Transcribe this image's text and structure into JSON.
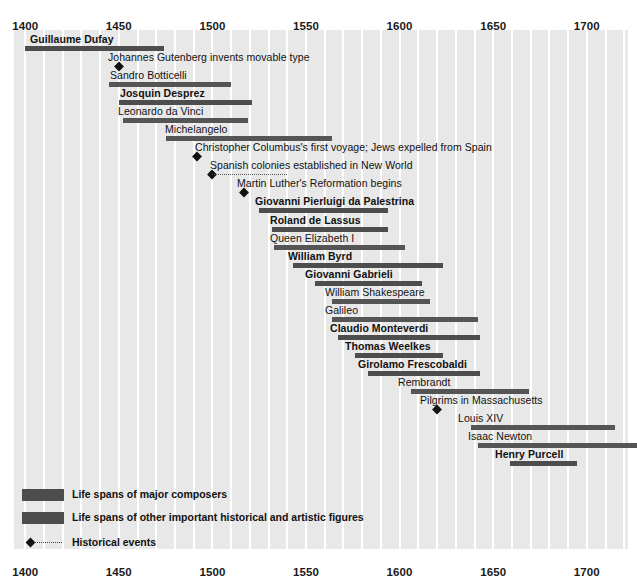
{
  "chart_data": {
    "type": "table",
    "title": "",
    "xlabel": "",
    "ylabel": "",
    "xlim": [
      1394,
      1722
    ],
    "grid": true,
    "grid_interval": 10,
    "legend_position": "bottom-left",
    "axis": {
      "ticks": [
        1400,
        1450,
        1500,
        1550,
        1600,
        1650,
        1700
      ],
      "tick_labels": [
        "1400",
        "1450",
        "1500",
        "1550",
        "1600",
        "1650",
        "1700"
      ],
      "top_axis": true,
      "bottom_axis": true
    },
    "categories": [
      "Guillaume Dufay",
      "Johannes Gutenberg invents movable type",
      "Sandro Botticelli",
      "Josquin Desprez",
      "Leonardo da Vinci",
      "Michelangelo",
      "Christopher Columbus's first voyage; Jews expelled from Spain",
      "Spanish colonies established in New World",
      "Martin Luther's Reformation begins",
      "Giovanni Pierluigi da Palestrina",
      "Roland de Lassus",
      "Queen Elizabeth I",
      "William Byrd",
      "Giovanni Gabrieli",
      "William Shakespeare",
      "Galileo",
      "Claudio Monteverdi",
      "Thomas Weelkes",
      "Girolamo Frescobaldi",
      "Rembrandt",
      "Pilgrims in Massachusetts",
      "Louis XIV",
      "Isaac Newton",
      "Henry Purcell"
    ],
    "series": [
      {
        "name": "Life spans of major composers",
        "color": "#4d4d4d",
        "spans": [
          {
            "label": "Guillaume Dufay",
            "start": 1400,
            "end": 1474
          },
          {
            "label": "Josquin Desprez",
            "start": 1450,
            "end": 1521
          },
          {
            "label": "Giovanni Pierluigi da Palestrina",
            "start": 1525,
            "end": 1594
          },
          {
            "label": "Roland de Lassus",
            "start": 1532,
            "end": 1594
          },
          {
            "label": "William Byrd",
            "start": 1543,
            "end": 1623
          },
          {
            "label": "Giovanni Gabrieli",
            "start": 1555,
            "end": 1612
          },
          {
            "label": "Claudio Monteverdi",
            "start": 1567,
            "end": 1643
          },
          {
            "label": "Thomas Weelkes",
            "start": 1576,
            "end": 1623
          },
          {
            "label": "Girolamo Frescobaldi",
            "start": 1583,
            "end": 1643
          },
          {
            "label": "Henry Purcell",
            "start": 1659,
            "end": 1695
          }
        ]
      },
      {
        "name": "Life spans of other important historical and artistic figures",
        "color": "#555555",
        "spans": [
          {
            "label": "Sandro Botticelli",
            "start": 1445,
            "end": 1510
          },
          {
            "label": "Leonardo da Vinci",
            "start": 1452,
            "end": 1519
          },
          {
            "label": "Michelangelo",
            "start": 1475,
            "end": 1564
          },
          {
            "label": "Queen Elizabeth I",
            "start": 1533,
            "end": 1603
          },
          {
            "label": "William Shakespeare",
            "start": 1564,
            "end": 1616
          },
          {
            "label": "Galileo",
            "start": 1564,
            "end": 1642
          },
          {
            "label": "Rembrandt",
            "start": 1606,
            "end": 1669
          },
          {
            "label": "Louis XIV",
            "start": 1638,
            "end": 1715
          },
          {
            "label": "Isaac Newton",
            "start": 1642,
            "end": 1727
          }
        ]
      }
    ],
    "events": [
      {
        "label": "Johannes Gutenberg invents movable type",
        "year": 1450
      },
      {
        "label": "Christopher Columbus's first voyage; Jews expelled from Spain",
        "year": 1492
      },
      {
        "label": "Spanish colonies established in New World",
        "year": 1500,
        "span_end": 1540
      },
      {
        "label": "Martin Luther's Reformation begins",
        "year": 1517
      },
      {
        "label": "Pilgrims in Massachusetts",
        "year": 1620
      }
    ]
  },
  "rows": [
    {
      "label": "Guillaume Dufay",
      "kind": "composer",
      "start": 1400,
      "end": 1474,
      "label_x": 30
    },
    {
      "label": "Johannes Gutenberg invents movable type",
      "kind": "event",
      "year": 1450,
      "label_x": 108
    },
    {
      "label": "Sandro Botticelli",
      "kind": "other",
      "start": 1445,
      "end": 1510,
      "label_x": 110
    },
    {
      "label": "Josquin Desprez",
      "kind": "composer",
      "start": 1450,
      "end": 1521,
      "label_x": 120
    },
    {
      "label": "Leonardo da Vinci",
      "kind": "other",
      "start": 1452,
      "end": 1519,
      "label_x": 118
    },
    {
      "label": "Michelangelo",
      "kind": "other",
      "start": 1475,
      "end": 1564,
      "label_x": 165
    },
    {
      "label": "Christopher Columbus's first voyage; Jews expelled from Spain",
      "kind": "event",
      "year": 1492,
      "label_x": 195
    },
    {
      "label": "Spanish colonies established in New World",
      "kind": "event",
      "year": 1500,
      "span_end": 1540,
      "label_x": 210
    },
    {
      "label": "Martin Luther's Reformation begins",
      "kind": "event",
      "year": 1517,
      "label_x": 237
    },
    {
      "label": "Giovanni Pierluigi da Palestrina",
      "kind": "composer",
      "start": 1525,
      "end": 1594,
      "label_x": 255
    },
    {
      "label": "Roland de Lassus",
      "kind": "composer",
      "start": 1532,
      "end": 1594,
      "label_x": 270
    },
    {
      "label": "Queen Elizabeth I",
      "kind": "other",
      "start": 1533,
      "end": 1603,
      "label_x": 270
    },
    {
      "label": "William Byrd",
      "kind": "composer",
      "start": 1543,
      "end": 1623,
      "label_x": 288
    },
    {
      "label": "Giovanni Gabrieli",
      "kind": "composer",
      "start": 1555,
      "end": 1612,
      "label_x": 305
    },
    {
      "label": "William Shakespeare",
      "kind": "other",
      "start": 1564,
      "end": 1616,
      "label_x": 325
    },
    {
      "label": "Galileo",
      "kind": "other",
      "start": 1564,
      "end": 1642,
      "label_x": 325
    },
    {
      "label": "Claudio Monteverdi",
      "kind": "composer",
      "start": 1567,
      "end": 1643,
      "label_x": 330
    },
    {
      "label": "Thomas Weelkes",
      "kind": "composer",
      "start": 1576,
      "end": 1623,
      "label_x": 345
    },
    {
      "label": "Girolamo Frescobaldi",
      "kind": "composer",
      "start": 1583,
      "end": 1643,
      "label_x": 358
    },
    {
      "label": "Rembrandt",
      "kind": "other",
      "start": 1606,
      "end": 1669,
      "label_x": 398
    },
    {
      "label": "Pilgrims in Massachusetts",
      "kind": "event",
      "year": 1620,
      "label_x": 420
    },
    {
      "label": "Louis XIV",
      "kind": "other",
      "start": 1638,
      "end": 1715,
      "label_x": 458
    },
    {
      "label": "Isaac Newton",
      "kind": "other",
      "start": 1642,
      "end": 1727,
      "label_x": 468
    },
    {
      "label": "Henry Purcell",
      "kind": "composer",
      "start": 1659,
      "end": 1695,
      "label_x": 495
    }
  ],
  "legend": {
    "items": [
      {
        "type": "swatch",
        "label": "Life spans of major composers"
      },
      {
        "type": "swatch",
        "label": "Life spans of other important historical and artistic figures"
      },
      {
        "type": "event",
        "label": "Historical events"
      }
    ]
  },
  "colors": {
    "bar_composer": "#4d4d4d",
    "bar_other": "#555555",
    "plot_background": "#e8e8e8",
    "gridline": "#ffffff",
    "text": "#111111",
    "page_background": "#ffffff"
  }
}
